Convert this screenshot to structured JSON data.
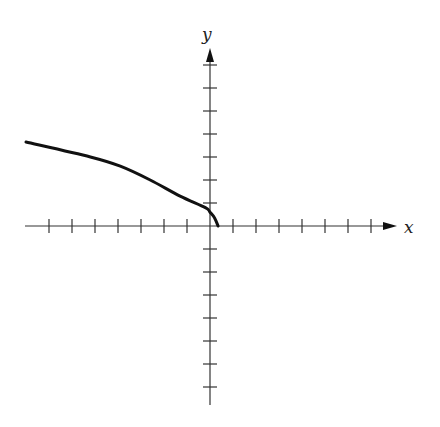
{
  "chart_data": {
    "type": "line",
    "title": "",
    "xlabel": "x",
    "ylabel": "y",
    "grid": false,
    "legend": null,
    "xlim": [
      -8,
      8
    ],
    "ylim": [
      -8,
      8
    ],
    "x_ticks": [
      -7,
      -6,
      -5,
      -4,
      -3,
      -2,
      -1,
      1,
      2,
      3,
      4,
      5,
      6,
      7
    ],
    "y_ticks": [
      -7,
      -6,
      -5,
      -4,
      -3,
      -2,
      -1,
      1,
      2,
      3,
      4,
      5,
      6,
      7
    ],
    "tick_labels_shown": false,
    "series": [
      {
        "name": "curve",
        "x": [
          -8.0,
          -5.2,
          -3.9,
          -2.6,
          -1.3,
          -0.2,
          0.0,
          0.2,
          0.35
        ],
        "y": [
          3.65,
          3.0,
          2.6,
          2.0,
          1.3,
          0.8,
          0.6,
          0.35,
          0.0
        ]
      }
    ],
    "colors": {
      "curve": "#111111",
      "axes": "#333333"
    }
  },
  "axes": {
    "x_label": "x",
    "y_label": "y"
  }
}
